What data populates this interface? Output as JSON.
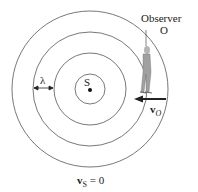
{
  "diagram": {
    "source_label": "S",
    "observer_label": "Observer",
    "observer_symbol": "O",
    "wavelength_label": "λ",
    "observer_velocity_label": "v",
    "observer_velocity_sub": "O",
    "source_velocity_label": "v",
    "source_velocity_sub": "S",
    "source_velocity_value": "= 0",
    "wavefront_radii": [
      15,
      36,
      57,
      78
    ],
    "colors": {
      "line": "#555555",
      "arrow": "#222222",
      "figure": "#9a9a9a"
    }
  }
}
